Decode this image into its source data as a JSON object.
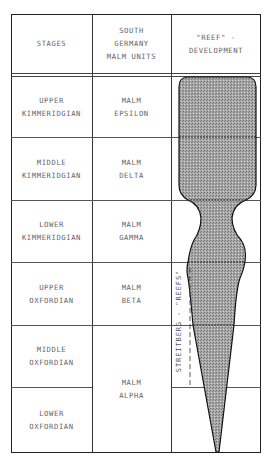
{
  "header": {
    "col1": "STAGES",
    "col2": "SOUTH\nGERMANY\nMALM UNITS",
    "col3": "\"REEF\" -\nDEVELOPMENT"
  },
  "rows": [
    {
      "stage": "UPPER\nKIMMERIDGIAN",
      "unit": "MALM\nEPSILON"
    },
    {
      "stage": "MIDDLE\nKIMMERIDGIAN",
      "unit": "MALM\nDELTA"
    },
    {
      "stage": "LOWER\nKIMMERIDGIAN",
      "unit": "MALM\nGAMMA"
    },
    {
      "stage": "UPPER\nOXFORDIAN",
      "unit": "MALM\nBETA"
    },
    {
      "stage": "MIDDLE\nOXFORDIAN",
      "unit": "MALM\nALPHA"
    },
    {
      "stage": "LOWER\nOXFORDIAN",
      "unit": ""
    }
  ],
  "reef_label": "STREITBERG - \"REEFS\"",
  "colors": {
    "line": "#333333",
    "reef_fill": "#9a9a9a",
    "text": "#666666"
  }
}
